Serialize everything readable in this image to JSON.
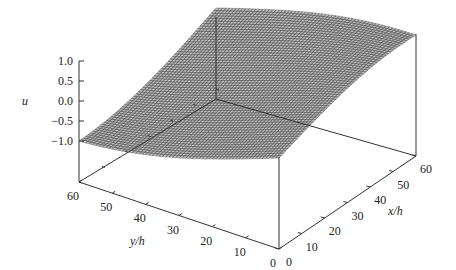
{
  "chart_data": {
    "type": "surface",
    "title": "",
    "xlabel": "x/h",
    "ylabel": "y/h",
    "zlabel": "u",
    "x_ticks": [
      0,
      10,
      20,
      30,
      40,
      50,
      60
    ],
    "y_ticks": [
      0,
      10,
      20,
      30,
      40,
      50,
      60
    ],
    "z_ticks": [
      -1.0,
      -0.5,
      0.0,
      0.5,
      1.0
    ],
    "z_tick_labels": [
      "−1.0",
      "−0.5",
      "0.0",
      "0.5",
      "1.0"
    ],
    "xlim": [
      0,
      60
    ],
    "ylim": [
      0,
      60
    ],
    "zlim": [
      -1.0,
      1.0
    ],
    "grid_resolution": 60,
    "corner_values": {
      "x0_y0": 0.25,
      "x60_y0": 1.0,
      "x0_y60": -1.0,
      "x60_y60": 0.0
    },
    "surface_description": "u increases from -1.0 at (x=0,y=60) to 1.0 at (x=60,y=0); smooth sinusoidal-like surface in (x - y)",
    "mesh_color": "#555555",
    "face_color": "#bdbdbd"
  }
}
